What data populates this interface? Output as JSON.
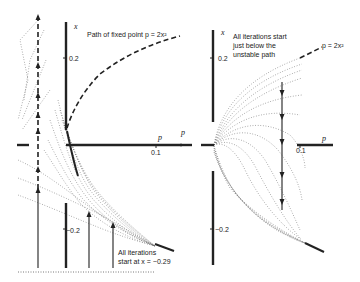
{
  "figure": {
    "left_panel": {
      "axis_x_label": "x",
      "axis_p_label": "p",
      "tick_x_pos": "0.2",
      "tick_x_neg": "−0.2",
      "tick_p": "0.1",
      "annotation_fixed_point": "Path of fixed point p = 2x²",
      "annotation_start_line1": "All iterations",
      "annotation_start_line2": "start at x = −0.29"
    },
    "right_panel": {
      "axis_x_label": "x",
      "axis_p_label": "p",
      "tick_x_pos": "0.2",
      "tick_x_neg": "−0.2",
      "tick_p": "0.1",
      "annotation_start_line1": "All iterations start",
      "annotation_start_line2": "just below the",
      "annotation_start_line3": "unstable path",
      "curve_label": "p = 2x²"
    }
  }
}
